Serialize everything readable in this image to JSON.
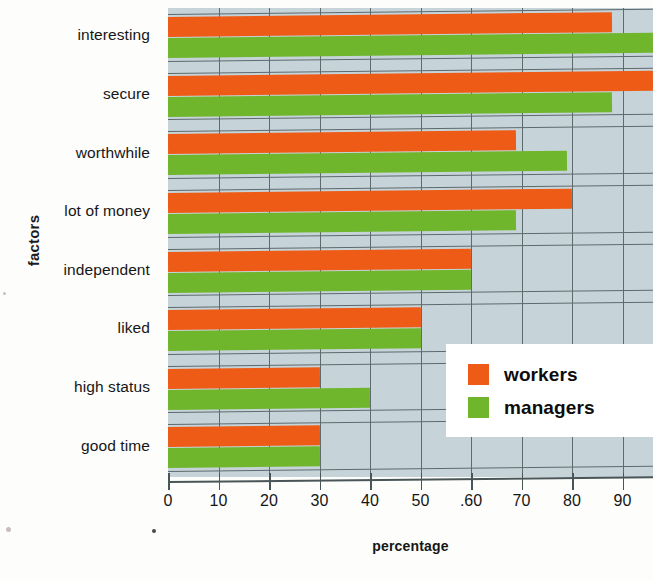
{
  "chart_data": {
    "type": "bar",
    "orientation": "horizontal",
    "title": "",
    "xlabel": "percentage",
    "ylabel": "factors",
    "xlim": [
      0,
      96
    ],
    "xticks": [
      0,
      10,
      20,
      30,
      40,
      50,
      60,
      70,
      80,
      90
    ],
    "xtick_labels": [
      "0",
      "10",
      "20",
      "30",
      "40",
      "50",
      ".60",
      "70",
      "80",
      "90"
    ],
    "grid": true,
    "legend_position": "bottom-right",
    "categories": [
      "interesting",
      "secure",
      "worthwhile",
      "lot of money",
      "independent",
      "liked",
      "high status",
      "good time"
    ],
    "series": [
      {
        "name": "workers",
        "color": "#ee5b16",
        "values": [
          88,
          96,
          69,
          80,
          60,
          50,
          30,
          30
        ]
      },
      {
        "name": "managers",
        "color": "#6fb62c",
        "values": [
          96,
          88,
          79,
          69,
          60,
          50,
          40,
          30
        ]
      }
    ]
  },
  "axis": {
    "y_title": "factors",
    "x_title": "percentage"
  },
  "legend": {
    "entries": [
      {
        "label": "workers",
        "color": "#ee5b16"
      },
      {
        "label": "managers",
        "color": "#6fb62c"
      }
    ]
  },
  "colors": {
    "plot_background": "#c6d4d9",
    "gridline": "#5d6a6e",
    "axis": "#4a5558",
    "workers": "#ee5b16",
    "managers": "#6fb62c",
    "page_background": "#fdfdfc"
  }
}
